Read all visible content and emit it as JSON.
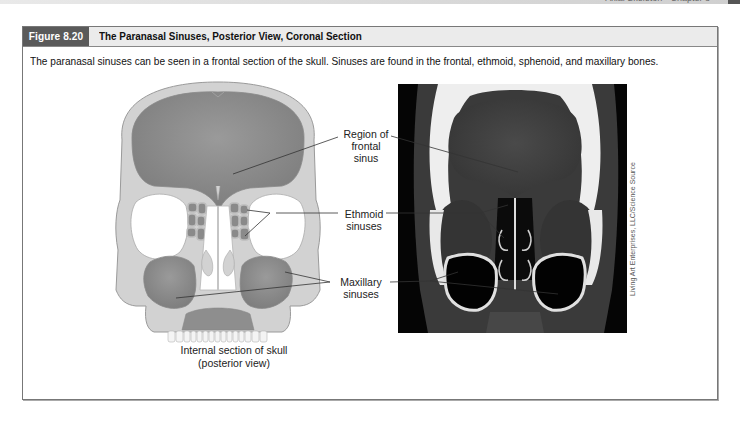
{
  "page_header": {
    "running_head": "Axial Skeleton • Chapter 8"
  },
  "figure": {
    "number": "Figure 8.20",
    "title": "The Paranasal Sinuses, Posterior View, Coronal Section",
    "caption": "The paranasal sinuses can be seen in a frontal section of the skull. Sinuses are found in the frontal, ethmoid, sphenoid, and maxillary bones.",
    "illustration": {
      "caption_line1": "Internal section of skull",
      "caption_line2": "(posterior view)"
    },
    "labels": [
      {
        "line1": "Region of",
        "line2": "frontal sinus"
      },
      {
        "line1": "Ethmoid",
        "line2": "sinuses"
      },
      {
        "line1": "Maxillary",
        "line2": "sinuses"
      }
    ],
    "photo_credit": "Living Art Enterprises, LLC/Science Source"
  },
  "colors": {
    "header_dark": "#5a5a5a",
    "header_light": "#ebebeb",
    "bone": "#cfcfcf",
    "sinus": "#8c8c8c",
    "ct_black": "#050505"
  }
}
